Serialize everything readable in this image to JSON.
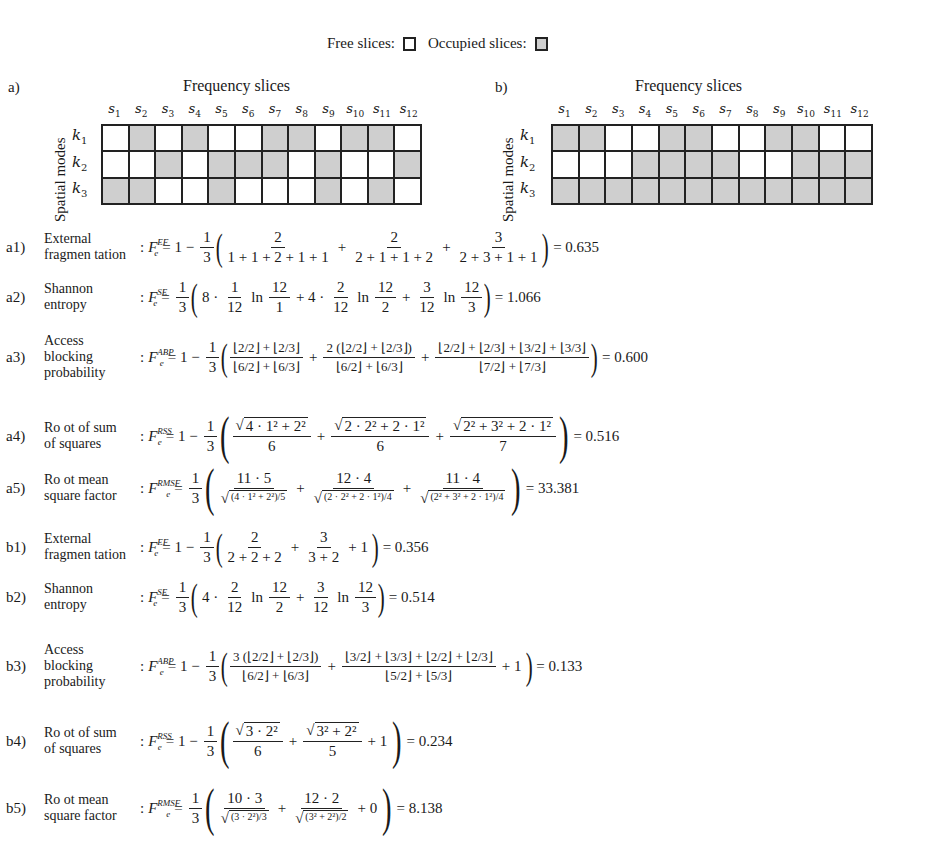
{
  "legend": {
    "free_label": "Free slices:",
    "occupied_label": "Occupied  slices:",
    "colors": {
      "free": "#ffffff",
      "occupied": "#cfcfcf",
      "border": "#222222"
    }
  },
  "panels": [
    {
      "id": "a",
      "label": "a)",
      "x_title": "Frequency slices",
      "y_title": "Spatial  modes",
      "columns": [
        "s1",
        "s2",
        "s3",
        "s4",
        "s5",
        "s6",
        "s7",
        "s8",
        "s9",
        "s10",
        "s11",
        "s12"
      ],
      "rows": [
        "k1",
        "k2",
        "k3"
      ],
      "occupancy": [
        [
          0,
          1,
          0,
          1,
          0,
          0,
          1,
          1,
          0,
          1,
          1,
          0
        ],
        [
          0,
          0,
          1,
          0,
          1,
          1,
          1,
          0,
          1,
          0,
          0,
          1
        ],
        [
          1,
          1,
          0,
          0,
          1,
          0,
          0,
          0,
          1,
          0,
          1,
          0
        ]
      ]
    },
    {
      "id": "b",
      "label": "b)",
      "x_title": "Frequency slices",
      "y_title": "Spatial  modes",
      "columns": [
        "s1",
        "s2",
        "s3",
        "s4",
        "s5",
        "s6",
        "s7",
        "s8",
        "s9",
        "s10",
        "s11",
        "s12"
      ],
      "rows": [
        "k1",
        "k2",
        "k3"
      ],
      "occupancy": [
        [
          1,
          1,
          0,
          0,
          1,
          1,
          0,
          0,
          1,
          1,
          0,
          0
        ],
        [
          0,
          0,
          0,
          1,
          1,
          1,
          1,
          0,
          0,
          1,
          1,
          1
        ],
        [
          1,
          1,
          1,
          1,
          1,
          1,
          1,
          1,
          1,
          1,
          1,
          1
        ]
      ]
    }
  ],
  "equations": [
    {
      "id": "a1)",
      "name_l1": "External",
      "name_l2": "fragmen tation",
      "metric": "EF",
      "lead": "= 1 −",
      "coef": {
        "n": "1",
        "d": "3"
      },
      "terms": [
        {
          "n": "2",
          "d": "1 + 1 + 2 + 1 + 1"
        },
        {
          "n": "2",
          "d": "2 + 1 + 1 + 2"
        },
        {
          "n": "3",
          "d": "2 + 3 + 1 + 1"
        }
      ],
      "result": "= 0.635"
    },
    {
      "id": "a2)",
      "name_l1": "Shannon",
      "name_l2": "entropy",
      "metric": "SE",
      "lead": "=",
      "coef": {
        "n": "1",
        "d": "3"
      },
      "text": [
        "8 ·",
        "1",
        "12",
        "ln",
        "12",
        "1",
        "+ 4 ·",
        "2",
        "12",
        "ln",
        "12",
        "2",
        "+",
        "3",
        "12",
        "ln",
        "12",
        "3"
      ],
      "result": "= 1.066"
    },
    {
      "id": "a3)",
      "name_l1": "Access",
      "name_l2": "blocking",
      "name_l3": "probability",
      "metric": "ABP",
      "lead": "= 1 −",
      "coef": {
        "n": "1",
        "d": "3"
      },
      "terms": [
        {
          "n": "⌊2/2⌋ + ⌊2/3⌋",
          "d": "⌊6/2⌋ + ⌊6/3⌋"
        },
        {
          "n": "2 (⌊2/2⌋ + ⌊2/3⌋)",
          "d": "⌊6/2⌋ + ⌊6/3⌋"
        },
        {
          "n": "⌊2/2⌋ + ⌊2/3⌋ + ⌊3/2⌋ + ⌊3/3⌋",
          "d": "⌊7/2⌋ + ⌊7/3⌋"
        }
      ],
      "result": "= 0.600"
    },
    {
      "id": "a4)",
      "name_l1": "Ro ot of sum",
      "name_l2": "of squares",
      "metric": "RSS",
      "lead": "= 1 −",
      "coef": {
        "n": "1",
        "d": "3"
      },
      "terms": [
        {
          "n": "4 · 1² + 2²",
          "d": "6"
        },
        {
          "n": "2 · 2² + 2 · 1²",
          "d": "6"
        },
        {
          "n": "2² + 3² + 2 · 1²",
          "d": "7"
        }
      ],
      "result": "= 0.516"
    },
    {
      "id": "a5)",
      "name_l1": "Ro ot mean",
      "name_l2": "square factor",
      "metric": "RMSF",
      "lead": "=",
      "coef": {
        "n": "1",
        "d": "3"
      },
      "terms": [
        {
          "n": "11 · 5",
          "d": "(4 · 1² + 2²)/5"
        },
        {
          "n": "12 · 4",
          "d": "(2 · 2² + 2 · 1²)/4"
        },
        {
          "n": "11 · 4",
          "d": "(2² + 3² + 2 · 1²)/4"
        }
      ],
      "result": "= 33.381"
    },
    {
      "id": "b1)",
      "name_l1": "External",
      "name_l2": "fragmen tation",
      "metric": "EF",
      "lead": "= 1 −",
      "coef": {
        "n": "1",
        "d": "3"
      },
      "terms": [
        {
          "n": "2",
          "d": "2 + 2 + 2"
        },
        {
          "n": "3",
          "d": "3 + 2"
        }
      ],
      "tail": "+ 1",
      "result": "= 0.356"
    },
    {
      "id": "b2)",
      "name_l1": "Shannon",
      "name_l2": "entropy",
      "metric": "SE",
      "lead": "=",
      "coef": {
        "n": "1",
        "d": "3"
      },
      "text": [
        "4 ·",
        "2",
        "12",
        "ln",
        "12",
        "2",
        "+",
        "3",
        "12",
        "ln",
        "12",
        "3"
      ],
      "result": "= 0.514"
    },
    {
      "id": "b3)",
      "name_l1": "Access",
      "name_l2": "blocking",
      "name_l3": "probability",
      "metric": "ABP",
      "lead": "= 1 −",
      "coef": {
        "n": "1",
        "d": "3"
      },
      "terms": [
        {
          "n": "3 (⌊2/2⌋ + ⌊2/3⌋)",
          "d": "⌊6/2⌋ + ⌊6/3⌋"
        },
        {
          "n": "⌊3/2⌋ + ⌊3/3⌋ + ⌊2/2⌋ + ⌊2/3⌋",
          "d": "⌊5/2⌋ + ⌊5/3⌋"
        }
      ],
      "tail": "+ 1",
      "result": "= 0.133"
    },
    {
      "id": "b4)",
      "name_l1": "Ro ot of sum",
      "name_l2": "of squares",
      "metric": "RSS",
      "lead": "= 1 −",
      "coef": {
        "n": "1",
        "d": "3"
      },
      "terms": [
        {
          "n": "3 · 2²",
          "d": "6"
        },
        {
          "n": "3² + 2²",
          "d": "5"
        }
      ],
      "tail": "+ 1",
      "result": "= 0.234"
    },
    {
      "id": "b5)",
      "name_l1": "Ro ot mean",
      "name_l2": "square factor",
      "metric": "RMSF",
      "lead": "=",
      "coef": {
        "n": "1",
        "d": "3"
      },
      "terms": [
        {
          "n": "10 · 3",
          "d": "(3 · 2²)/3"
        },
        {
          "n": "12 · 2",
          "d": "(3² + 2²)/2"
        }
      ],
      "tail": "+ 0",
      "result": "= 8.138"
    }
  ]
}
